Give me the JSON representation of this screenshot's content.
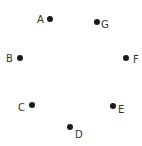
{
  "diagram": {
    "type": "points",
    "dot_color": "#1a1a1a",
    "label_color": "#333333",
    "points": [
      {
        "label": "A",
        "x": 50,
        "y": 19,
        "lx": 37,
        "ly": 23
      },
      {
        "label": "G",
        "x": 97,
        "y": 22,
        "lx": 101,
        "ly": 28
      },
      {
        "label": "B",
        "x": 20,
        "y": 58,
        "lx": 6,
        "ly": 62
      },
      {
        "label": "F",
        "x": 126,
        "y": 58,
        "lx": 133,
        "ly": 63
      },
      {
        "label": "C",
        "x": 32,
        "y": 105,
        "lx": 18,
        "ly": 111
      },
      {
        "label": "E",
        "x": 113,
        "y": 106,
        "lx": 118,
        "ly": 113
      },
      {
        "label": "D",
        "x": 70,
        "y": 127,
        "lx": 75,
        "ly": 138
      }
    ]
  }
}
